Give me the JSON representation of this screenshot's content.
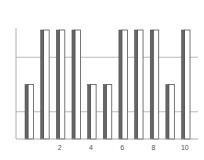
{
  "chart_data": {
    "type": "bar",
    "title": "",
    "xlabel": "",
    "ylabel": "",
    "categories": [
      1,
      2,
      3,
      4,
      5,
      6,
      7,
      8,
      9,
      10,
      11
    ],
    "series": [
      {
        "name": "series-dark",
        "color": "#666666",
        "values": [
          2,
          4,
          4,
          4,
          2,
          2,
          4,
          4,
          4,
          2,
          4
        ]
      },
      {
        "name": "series-light",
        "color": "#ffffff",
        "values": [
          2,
          4,
          4,
          4,
          2,
          2,
          4,
          4,
          4,
          2,
          4
        ]
      }
    ],
    "x_tick_labels": [
      "2",
      "4",
      "6",
      "8",
      "10"
    ],
    "x_tick_values": [
      2,
      4,
      6,
      8,
      10
    ],
    "ylim": [
      0,
      4
    ],
    "y_gridlines": [
      1,
      3
    ],
    "grid": true,
    "legend": "none"
  },
  "colors": {
    "axis": "#999999",
    "grid": "#aaaaaa",
    "bar_dark": "#666666",
    "bar_light_fill": "#ffffff",
    "bar_outline": "#555555"
  }
}
